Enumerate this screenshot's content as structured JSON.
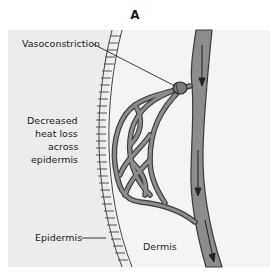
{
  "figure": {
    "panel_letter": "A",
    "labels": {
      "vasoconstriction": "Vasoconstriction",
      "heat_loss_line1": "Decreased",
      "heat_loss_line2": "heat loss",
      "heat_loss_line3": "across",
      "heat_loss_line4": "epidermis",
      "epidermis": "Epidermis",
      "dermis": "Dermis"
    },
    "colors": {
      "outer_bg": "#ececec",
      "dermis_bg": "#f4f4f4",
      "vessel_fill": "#8c8c8c",
      "vessel_outline": "#3a3a3a",
      "epidermis_stripe": "#444444"
    }
  }
}
